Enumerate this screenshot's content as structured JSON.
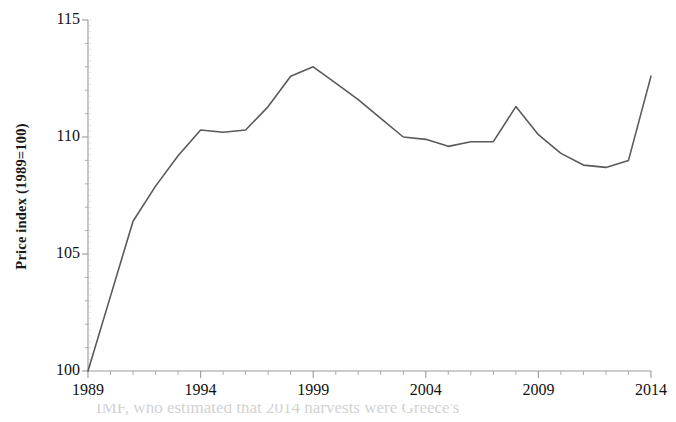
{
  "chart_data": {
    "type": "line",
    "title": "",
    "subtitle": "",
    "xlabel": "",
    "ylabel": "Price index (1989=100)",
    "ylim": [
      100,
      115
    ],
    "xlim": [
      1989,
      2014
    ],
    "ytick_labels": [
      "100",
      "105",
      "110",
      "115"
    ],
    "yticks": [
      100,
      105,
      110,
      115
    ],
    "xtick_labels": [
      "1989",
      "1994",
      "1999",
      "2004",
      "2009",
      "2014"
    ],
    "xticks": [
      1989,
      1994,
      1999,
      2004,
      2009,
      2014
    ],
    "minor_xticks_every": 1,
    "grid": false,
    "legend": false,
    "legend_position": "none",
    "line_color": "#5a5a5a",
    "line_width": 1.6,
    "axis_color": "#9a9a9a",
    "series": [
      {
        "name": "Price index (1989=100)",
        "x": [
          1989,
          1990,
          1991,
          1992,
          1993,
          1994,
          1995,
          1996,
          1997,
          1998,
          1999,
          2000,
          2001,
          2002,
          2003,
          2004,
          2005,
          2006,
          2007,
          2008,
          2009,
          2010,
          2011,
          2012,
          2013,
          2014
        ],
        "values": [
          100.0,
          103.2,
          106.4,
          107.9,
          109.2,
          110.3,
          110.2,
          110.3,
          111.3,
          112.6,
          113.0,
          112.3,
          111.6,
          110.8,
          110.0,
          109.9,
          109.6,
          109.8,
          109.8,
          111.3,
          110.1,
          109.3,
          108.8,
          108.7,
          109.0,
          112.6
        ]
      }
    ]
  },
  "axes": {
    "y_axis_label": "Price index (1989=100)",
    "y_tick_values": [
      "100",
      "105",
      "110",
      "115"
    ],
    "x_tick_values": [
      "1989",
      "1994",
      "1999",
      "2004",
      "2009",
      "2014"
    ]
  },
  "footer_artifact": {
    "text": "IMF, who estimated that 2014 harvests were Greece's"
  }
}
